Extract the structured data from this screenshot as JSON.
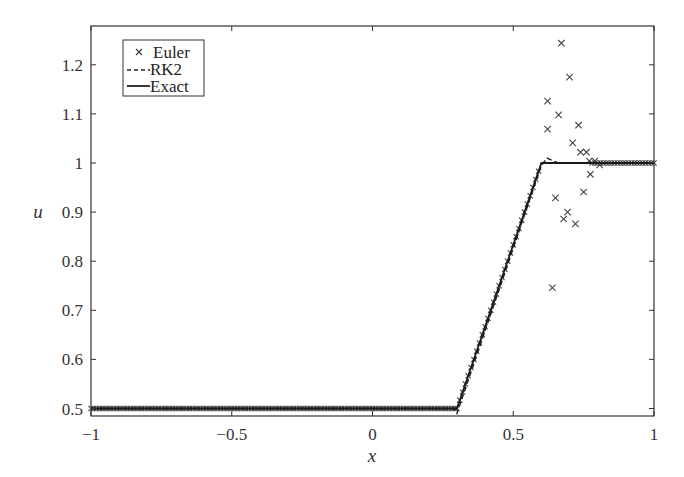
{
  "chart_data": {
    "type": "line",
    "title": "",
    "xlabel": "x",
    "ylabel": "u",
    "xlim": [
      -1,
      1
    ],
    "ylim": [
      0.484,
      1.28
    ],
    "xticks": [
      -1,
      -0.5,
      0,
      0.5,
      1
    ],
    "xtick_labels": [
      "−1",
      "−0.5",
      "0",
      "0.5",
      "1"
    ],
    "yticks": [
      0.5,
      0.6,
      0.7,
      0.8,
      0.9,
      1.0,
      1.1,
      1.2
    ],
    "ytick_labels": [
      "0.5",
      "0.6",
      "0.7",
      "0.8",
      "0.9",
      "1",
      "1.1",
      "1.2"
    ],
    "grid": false,
    "legend_position": "upper left",
    "legend": [
      {
        "label": "Euler",
        "style": "x-marker"
      },
      {
        "label": "RK2",
        "style": "dashed"
      },
      {
        "label": "Exact",
        "style": "solid"
      }
    ],
    "series": [
      {
        "name": "Exact",
        "style": "solid",
        "x": [
          -1,
          0.3,
          0.6,
          1
        ],
        "y": [
          0.5,
          0.5,
          1.0,
          1.0
        ]
      },
      {
        "name": "RK2",
        "style": "dashed",
        "x": [
          -1,
          0.29,
          0.3,
          0.6,
          0.62,
          0.64,
          0.66,
          1
        ],
        "y": [
          0.5,
          0.5,
          0.49,
          0.995,
          1.01,
          1.005,
          1.0,
          1.0
        ]
      },
      {
        "name": "Euler",
        "style": "x-marker",
        "ramp": {
          "x_start": -1,
          "x_plateau_end": 0.3,
          "x_ramp_end": 0.6,
          "x_end": 1,
          "u_low": 0.5,
          "u_high": 1.0,
          "dx": 0.01
        },
        "outliers": {
          "x": [
            0.671,
            0.7,
            0.622,
            0.661,
            0.622,
            0.732,
            0.711,
            0.739,
            0.76,
            0.77,
            0.79,
            0.807,
            0.774,
            0.75,
            0.65,
            0.693,
            0.679,
            0.721,
            0.639
          ],
          "y": [
            1.244,
            1.175,
            1.126,
            1.098,
            1.069,
            1.077,
            1.041,
            1.022,
            1.022,
            1.004,
            1.004,
            0.996,
            0.977,
            0.941,
            0.929,
            0.9,
            0.886,
            0.876,
            0.746
          ]
        }
      }
    ]
  },
  "colors": {
    "line": "#1a1a1a",
    "axis": "#333333",
    "marker": "#444444",
    "background": "#ffffff"
  }
}
